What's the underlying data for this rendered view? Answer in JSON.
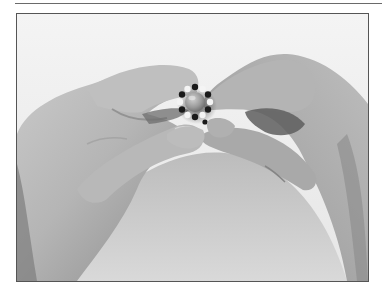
{
  "image": {
    "description": "Grayscale photograph of two hands holding a small beaded ring between thumbs and index fingers",
    "subject": "beaded ring with gray center stone and alternating black and white seed beads",
    "style": "black and white photo",
    "colors": {
      "background": "#f2f2f2",
      "skin_light": "#d4d4d4",
      "skin_mid": "#a8a8a8",
      "skin_dark": "#6f6f6f",
      "bead_dark": "#1a1a1a",
      "bead_light": "#f4f4f4",
      "stone": "#9a9a9a",
      "frame_border": "#555555",
      "rule": "#6a6a6a"
    }
  }
}
